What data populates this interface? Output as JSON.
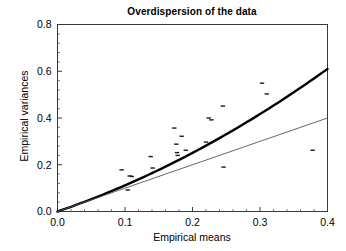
{
  "chart_data": {
    "type": "scatter",
    "title": "Overdispersion of the data",
    "xlabel": "Empirical means",
    "ylabel": "Empirical variances",
    "xlim": [
      0.0,
      0.4
    ],
    "ylim": [
      0.0,
      0.8
    ],
    "xticks": [
      0.0,
      0.1,
      0.2,
      0.3,
      0.4
    ],
    "xticklabels": [
      "0.0",
      "0.1",
      "0.2",
      "0.3",
      "0.4"
    ],
    "yticks": [
      0.0,
      0.2,
      0.4,
      0.6,
      0.8
    ],
    "yticklabels": [
      "0.0",
      "0.2",
      "0.4",
      "0.6",
      "0.8"
    ],
    "minor_ticks": true,
    "grid": false,
    "legend": null,
    "points": [
      [
        0.095,
        0.178
      ],
      [
        0.104,
        0.092
      ],
      [
        0.107,
        0.152
      ],
      [
        0.11,
        0.15
      ],
      [
        0.138,
        0.235
      ],
      [
        0.141,
        0.186
      ],
      [
        0.173,
        0.357
      ],
      [
        0.176,
        0.288
      ],
      [
        0.177,
        0.252
      ],
      [
        0.178,
        0.24
      ],
      [
        0.184,
        0.322
      ],
      [
        0.19,
        0.262
      ],
      [
        0.22,
        0.297
      ],
      [
        0.224,
        0.4
      ],
      [
        0.228,
        0.392
      ],
      [
        0.245,
        0.451
      ],
      [
        0.246,
        0.19
      ],
      [
        0.303,
        0.549
      ],
      [
        0.31,
        0.503
      ],
      [
        0.378,
        0.262
      ]
    ],
    "series": [
      {
        "name": "overdispersed-fit",
        "type": "curve",
        "style": "thick",
        "color": "#000000",
        "linewidth": 2.4,
        "endpoint": [
          0.4,
          0.61
        ],
        "description": "quadratic overdispersion curve through origin"
      },
      {
        "name": "poisson-reference",
        "type": "line",
        "style": "thin",
        "color": "#555555",
        "linewidth": 0.9,
        "endpoint": [
          0.4,
          0.4
        ],
        "description": "identity reference line variance = mean"
      }
    ]
  }
}
